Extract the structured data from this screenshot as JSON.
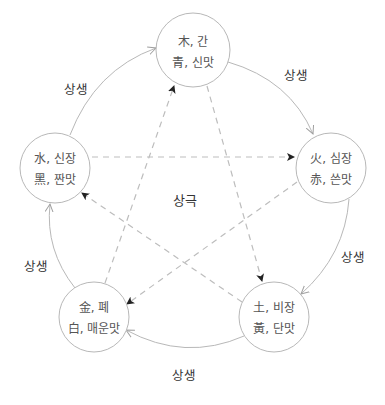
{
  "diagram": {
    "center_label": "상극",
    "colors": {
      "circle_stroke": "#b8b8b8",
      "arc_stroke": "#b8b8b8",
      "dash_stroke": "#bdbdbd",
      "arrow_fill": "#222222",
      "text": "#555555"
    },
    "nodes": [
      {
        "id": "wood",
        "line1": "木, 간",
        "line2": "青, 신맛"
      },
      {
        "id": "fire",
        "line1": "火, 심장",
        "line2": "赤, 쓴맛"
      },
      {
        "id": "earth",
        "line1": "土, 비장",
        "line2": "黃, 단맛"
      },
      {
        "id": "metal",
        "line1": "金, 폐",
        "line2": "白, 매운맛"
      },
      {
        "id": "water",
        "line1": "水, 신장",
        "line2": "黑, 짠맛"
      }
    ],
    "generating_labels": {
      "water_to_wood": "상생",
      "wood_to_fire": "상생",
      "fire_to_earth": "상생",
      "earth_to_metal": "상생",
      "metal_to_water": "상생"
    }
  }
}
